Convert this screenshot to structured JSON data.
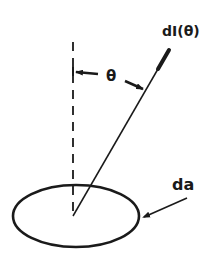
{
  "diagram": {
    "labels": {
      "intensity": "dI(θ)",
      "angle": "θ",
      "area": "da"
    },
    "colors": {
      "stroke": "#1a1a1a",
      "background": "#ffffff"
    },
    "elements": {
      "surface_element": "ellipse representing area element da",
      "normal_axis": "dashed vertical line (surface normal)",
      "ray": "solid line with arrow pointing to dI(θ)",
      "angle_marker": "θ between normal and ray"
    }
  }
}
